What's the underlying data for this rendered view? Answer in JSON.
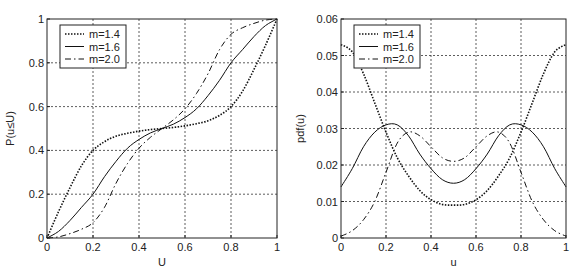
{
  "chart_data": [
    {
      "type": "line",
      "title": "",
      "xlabel": "U",
      "ylabel": "P(u≤U)",
      "xlim": [
        0,
        1
      ],
      "ylim": [
        0,
        1
      ],
      "xticks": [
        "0",
        "0.2",
        "0.4",
        "0.6",
        "0.8",
        "1"
      ],
      "yticks": [
        "0",
        "0.2",
        "0.4",
        "0.6",
        "0.8",
        "1"
      ],
      "grid": true,
      "legend_position": "upper left",
      "x": [
        0,
        0.05,
        0.1,
        0.15,
        0.2,
        0.25,
        0.3,
        0.35,
        0.4,
        0.45,
        0.5,
        0.55,
        0.6,
        0.65,
        0.7,
        0.75,
        0.8,
        0.85,
        0.9,
        0.95,
        1.0
      ],
      "series": [
        {
          "name": "m=1.4",
          "style": "dotted",
          "values": [
            0,
            0.12,
            0.23,
            0.33,
            0.4,
            0.44,
            0.465,
            0.478,
            0.488,
            0.495,
            0.5,
            0.505,
            0.512,
            0.522,
            0.535,
            0.56,
            0.6,
            0.67,
            0.77,
            0.88,
            1.0
          ]
        },
        {
          "name": "m=1.6",
          "style": "solid",
          "values": [
            0,
            0.03,
            0.08,
            0.14,
            0.2,
            0.28,
            0.35,
            0.41,
            0.45,
            0.48,
            0.5,
            0.52,
            0.55,
            0.59,
            0.65,
            0.72,
            0.8,
            0.86,
            0.92,
            0.97,
            1.0
          ]
        },
        {
          "name": "m=2.0",
          "style": "dashdot",
          "values": [
            0,
            0.005,
            0.02,
            0.04,
            0.07,
            0.14,
            0.25,
            0.34,
            0.41,
            0.46,
            0.5,
            0.54,
            0.59,
            0.66,
            0.75,
            0.86,
            0.93,
            0.96,
            0.98,
            0.995,
            1.0
          ]
        }
      ]
    },
    {
      "type": "line",
      "title": "",
      "xlabel": "u",
      "ylabel": "pdf(u)",
      "xlim": [
        0,
        1
      ],
      "ylim": [
        0,
        0.06
      ],
      "xticks": [
        "0",
        "0.2",
        "0.4",
        "0.6",
        "0.8",
        "1"
      ],
      "yticks": [
        "0",
        "0.01",
        "0.02",
        "0.03",
        "0.04",
        "0.05",
        "0.06"
      ],
      "grid": true,
      "legend_position": "upper left",
      "x": [
        0,
        0.05,
        0.1,
        0.15,
        0.2,
        0.25,
        0.3,
        0.35,
        0.4,
        0.45,
        0.5,
        0.55,
        0.6,
        0.65,
        0.7,
        0.75,
        0.8,
        0.85,
        0.9,
        0.95,
        1.0
      ],
      "series": [
        {
          "name": "m=1.4",
          "style": "dotted",
          "values": [
            0.053,
            0.051,
            0.045,
            0.037,
            0.029,
            0.022,
            0.017,
            0.013,
            0.0105,
            0.0092,
            0.009,
            0.0092,
            0.0105,
            0.013,
            0.017,
            0.022,
            0.029,
            0.037,
            0.045,
            0.051,
            0.053
          ]
        },
        {
          "name": "m=1.6",
          "style": "solid",
          "values": [
            0.014,
            0.019,
            0.025,
            0.029,
            0.031,
            0.031,
            0.028,
            0.023,
            0.019,
            0.016,
            0.015,
            0.016,
            0.019,
            0.023,
            0.028,
            0.031,
            0.031,
            0.029,
            0.025,
            0.019,
            0.014
          ]
        },
        {
          "name": "m=2.0",
          "style": "dashdot",
          "values": [
            0.0005,
            0.002,
            0.005,
            0.01,
            0.018,
            0.026,
            0.029,
            0.028,
            0.025,
            0.022,
            0.021,
            0.022,
            0.025,
            0.028,
            0.029,
            0.026,
            0.018,
            0.01,
            0.005,
            0.002,
            0.0005
          ]
        }
      ]
    }
  ]
}
